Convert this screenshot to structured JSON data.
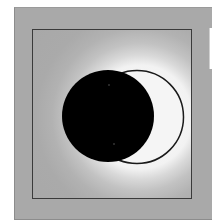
{
  "illustration": {
    "subject": "solar eclipse",
    "elements": {
      "moon": {
        "label": "moon disc",
        "color": "#000000"
      },
      "sun": {
        "label": "sun crescent",
        "color": "#f5f5f5",
        "outline": "#1a1a1a"
      },
      "corona": {
        "label": "corona glow",
        "color": "#ffffff"
      },
      "stars": [
        {
          "label": "star"
        },
        {
          "label": "star"
        }
      ]
    },
    "colors": {
      "panel": "#a9a9a9",
      "frame_border": "#3a3a3a",
      "background": "#ffffff"
    }
  },
  "side_card": {
    "label": ""
  }
}
